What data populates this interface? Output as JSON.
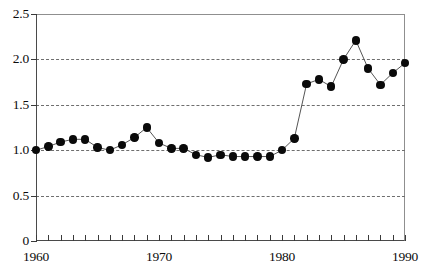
{
  "chart_data": {
    "type": "line",
    "title": "",
    "subtitle": "",
    "xlabel": "",
    "ylabel": "",
    "xlim": [
      1960,
      1990
    ],
    "ylim": [
      0,
      2.5
    ],
    "grid": true,
    "grid_style": "dashed horizontal",
    "legend": "none",
    "marker": "filled circle",
    "line_color": "#555555",
    "marker_color": "#0a0a0a",
    "y_ticks": [
      0,
      0.5,
      1.0,
      1.5,
      2.0,
      2.5
    ],
    "y_tick_labels": [
      "0",
      "0.5",
      "1.0",
      "1.5",
      "2.0",
      "2.5"
    ],
    "x_ticks": [
      1960,
      1961,
      1962,
      1963,
      1964,
      1965,
      1966,
      1967,
      1968,
      1969,
      1970,
      1971,
      1972,
      1973,
      1974,
      1975,
      1976,
      1977,
      1978,
      1979,
      1980,
      1981,
      1982,
      1983,
      1984,
      1985,
      1986,
      1987,
      1988,
      1989,
      1990
    ],
    "x_tick_labels_shown": [
      "1960",
      "1970",
      "1980",
      "1990"
    ],
    "x_labeled_ticks": [
      1960,
      1970,
      1980,
      1990
    ],
    "x": [
      1960,
      1961,
      1962,
      1963,
      1964,
      1965,
      1966,
      1967,
      1968,
      1969,
      1970,
      1971,
      1972,
      1973,
      1974,
      1975,
      1976,
      1977,
      1978,
      1979,
      1980,
      1981,
      1982,
      1983,
      1984,
      1985,
      1986,
      1987,
      1988,
      1989,
      1990
    ],
    "values": [
      1.0,
      1.04,
      1.09,
      1.12,
      1.12,
      1.03,
      1.0,
      1.06,
      1.14,
      1.25,
      1.08,
      1.02,
      1.02,
      0.95,
      0.92,
      0.95,
      0.93,
      0.93,
      0.93,
      0.93,
      1.0,
      1.13,
      1.73,
      1.78,
      1.7,
      2.0,
      2.21,
      1.9,
      1.72,
      1.85,
      1.96
    ]
  }
}
